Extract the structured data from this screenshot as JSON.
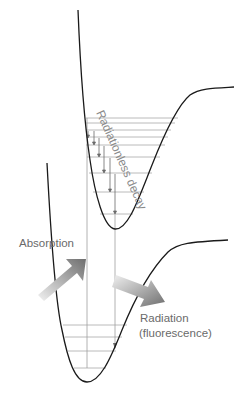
{
  "diagram": {
    "labels": {
      "radiationless": "Radiationless decay",
      "absorption": "Absorption",
      "radiation_line1": "Radiation",
      "radiation_line2": "(fluorescence)"
    },
    "colors": {
      "curve": "#1a1a1a",
      "levels": "#9a9a9a",
      "text": "#6a6a6a",
      "arrow_dark": "#707070",
      "arrow_light": "#e8e8e8"
    }
  }
}
